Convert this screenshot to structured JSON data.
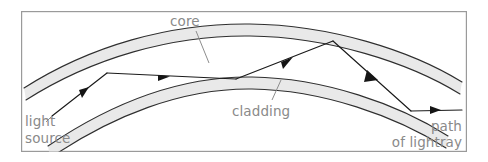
{
  "figure": {
    "kind": "optical-fibre-total-internal-reflection-diagram",
    "frame": {
      "x": 21,
      "y": 11,
      "width": 446,
      "height": 141,
      "border_color": "#9a9a9a"
    },
    "colors": {
      "band_fill": "#e9e9e9",
      "band_edge": "#2f2f2f",
      "ray": "#1a1a1a",
      "label_text": "#8a8a8a",
      "leader_line": "#8d8d8d",
      "background": "#ffffff"
    },
    "labels": {
      "core": "core",
      "cladding": "cladding",
      "light_source_line1": "light",
      "light_source_line2": "source",
      "path_line1": "path",
      "path_line2": "of lightray"
    }
  }
}
